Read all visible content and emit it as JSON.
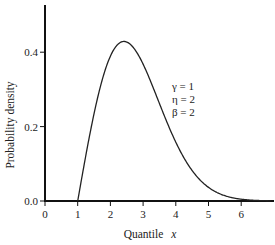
{
  "chart_data": {
    "type": "line",
    "title": "",
    "xlabel": "Quantile",
    "xlabel_var": "x",
    "ylabel": "Probability density",
    "xlim": [
      0,
      6.9
    ],
    "ylim": [
      0,
      0.52
    ],
    "xticks": [
      0,
      1,
      2,
      3,
      4,
      5,
      6
    ],
    "xtick_labels": [
      "0",
      "1",
      "2",
      "3",
      "4",
      "5",
      "6"
    ],
    "yticks": [
      0.0,
      0.2,
      0.4
    ],
    "ytick_labels": [
      "0.0",
      "0.2",
      "0.4"
    ],
    "grid": false,
    "legend": null,
    "annotations": [
      "γ = 1",
      "η = 2",
      "β = 2"
    ],
    "series": [
      {
        "name": "Weibull pdf (γ=1, η=2, β=2)",
        "x": [
          1.0,
          1.25,
          1.5,
          1.75,
          2.0,
          2.25,
          2.414,
          2.5,
          2.75,
          3.0,
          3.25,
          3.5,
          3.75,
          4.0,
          4.25,
          4.5,
          4.75,
          5.0,
          5.25,
          5.5,
          5.75,
          6.0,
          6.5,
          6.9
        ],
        "y": [
          0.0,
          0.123,
          0.235,
          0.326,
          0.389,
          0.424,
          0.429,
          0.428,
          0.406,
          0.368,
          0.316,
          0.262,
          0.207,
          0.158,
          0.116,
          0.082,
          0.055,
          0.037,
          0.023,
          0.014,
          0.008,
          0.005,
          0.001,
          0.0002
        ],
        "color": "#222222"
      }
    ],
    "parameters": {
      "gamma": 1,
      "eta": 2,
      "beta": 2
    }
  },
  "labels": {
    "ylabel": "Probability density",
    "xlabel_text": "Quantile",
    "xlabel_var": "x",
    "annot_gamma": "γ = 1",
    "annot_eta": "η = 2",
    "annot_beta": "β = 2",
    "xtick": [
      "0",
      "1",
      "2",
      "3",
      "4",
      "5",
      "6"
    ],
    "ytick": [
      "0.0",
      "0.2",
      "0.4"
    ]
  }
}
